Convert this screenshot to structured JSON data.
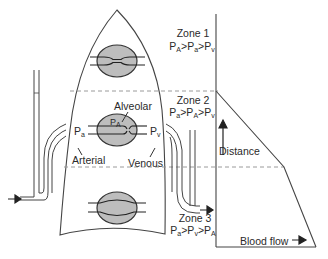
{
  "diagram": {
    "colors": {
      "line": "#3a3a3a",
      "alveolus_fill": "#bdbdbd",
      "dashed": "#9a9a9a",
      "background": "#ffffff"
    },
    "zones": [
      {
        "label": "Zone 1",
        "relation": {
          "p1": "P",
          "s1": "A",
          "p2": "P",
          "s2": "a",
          "p3": "P",
          "s3": "v"
        }
      },
      {
        "label": "Zone 2",
        "relation": {
          "p1": "P",
          "s1": "a",
          "p2": "P",
          "s2": "A",
          "p3": "P",
          "s3": "v"
        }
      },
      {
        "label": "Zone 3",
        "relation": {
          "p1": "P",
          "s1": "a",
          "p2": "P",
          "s2": "v",
          "p3": "P",
          "s3": "A"
        }
      }
    ],
    "labels": {
      "alveolar": "Alveolar",
      "pa_alveolar": {
        "p": "P",
        "s": "A"
      },
      "pa_arterial": {
        "p": "P",
        "s": "a"
      },
      "pv_venous": {
        "p": "P",
        "s": "v"
      },
      "arterial": "Arterial",
      "venous": "Venous",
      "distance": "Distance",
      "blood_flow": "Blood flow"
    },
    "graph": {
      "x_axis": "Blood flow",
      "y_axis": "Distance",
      "profile": "Zero flow in zone 1; flow increases linearly down zone 2; increases more slowly down zone 3"
    }
  }
}
